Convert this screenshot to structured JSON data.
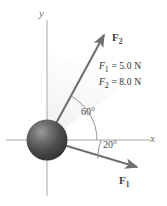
{
  "figure": {
    "background_color": "#ffffff"
  },
  "axes": {
    "y_label": "y",
    "x_label": "x",
    "color": "#9a9a9a"
  },
  "origin_object": {
    "name": "sphere",
    "color_dark": "#3a3a3a",
    "color_light": "#8c8c8c"
  },
  "vectors": [
    {
      "name": "F2",
      "label_symbol": "F",
      "label_subscript": "2",
      "angle_deg": 60,
      "angle_label": "60°",
      "color": "#7a7a7a"
    },
    {
      "name": "F1",
      "label_symbol": "F",
      "label_subscript": "1",
      "angle_deg": -20,
      "angle_label": "20°",
      "color": "#7a7a7a"
    }
  ],
  "legend": {
    "rows": [
      {
        "symbol": "F",
        "subscript": "1",
        "equals": "=",
        "value": "5.0 N"
      },
      {
        "symbol": "F",
        "subscript": "2",
        "equals": "=",
        "value": "8.0 N"
      }
    ]
  }
}
